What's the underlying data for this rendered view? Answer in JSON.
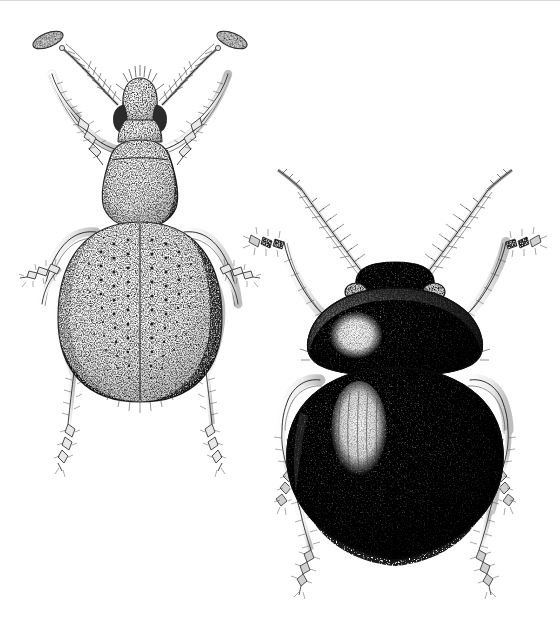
{
  "figure": {
    "kind": "scientific-illustration",
    "technique": "pen-and-ink stipple drawing",
    "view": "dorsal",
    "background_color": "#ffffff",
    "ink_color": "#1a1a1a",
    "width": 560,
    "height": 625,
    "caption": "",
    "labels": [],
    "scan_artifact": {
      "present": true,
      "type": "top-edge-line",
      "color": "#d8d8d8"
    }
  },
  "specimens": [
    {
      "id": "specimen-left",
      "common_name": "weevil",
      "family": "Curculionidae",
      "position": "upper-left",
      "tone": "pale",
      "shading": "light stipple",
      "body_fill": "#efefef",
      "center_x": 140,
      "center_y": 255,
      "body_length_px": 300,
      "parts": {
        "rostrum": "elongate snout with apical setae",
        "eyes": 2,
        "antennae": {
          "count": 2,
          "type": "geniculate-clubbed",
          "club": "elongate oval"
        },
        "pronotum": "pyriform, broad, finely punctate",
        "elytra": "oval, with longitudinal rows of punctures (striae)",
        "stria_rows": 10,
        "legs": {
          "count": 6,
          "femora": "clavate",
          "tarsi": "setose"
        }
      }
    },
    {
      "id": "specimen-right",
      "common_name": "leaf beetle",
      "family": "Chrysomelidae",
      "position": "lower-right",
      "tone": "dark",
      "shading": "dense stipple with specular highlights",
      "body_fill": "#3a3a3a",
      "center_x": 395,
      "center_y": 400,
      "body_length_px": 300,
      "parts": {
        "head": "transverse, dark, partly hidden by pronotum",
        "eyes": 2,
        "antennae": {
          "count": 2,
          "type": "filiform",
          "segments": 11,
          "setae": "bristly"
        },
        "pronotum": "strongly convex, with large pale highlight on left",
        "elytra": "broadly oval, convex, with pale elongate highlight and fine striae",
        "stria_rows": 5,
        "legs": {
          "count": 6,
          "femora": "stout",
          "tibiae": "setose",
          "tarsi": "setose"
        }
      }
    }
  ]
}
